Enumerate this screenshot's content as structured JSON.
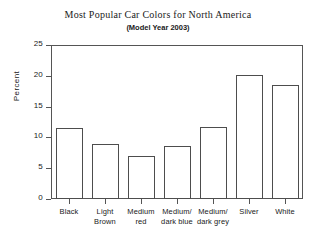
{
  "chart_data": {
    "type": "bar",
    "title": "Most Popular Car Colors for North America",
    "subtitle": "(Model Year 2003)",
    "xlabel": "",
    "ylabel": "Percent",
    "categories": [
      "Black",
      "Light Brown",
      "Medium red",
      "Medium/dark blue",
      "Medium/dark grey",
      "Silver",
      "White"
    ],
    "category_lines": [
      [
        "Black",
        ""
      ],
      [
        "Light",
        "Brown"
      ],
      [
        "Medium",
        "red"
      ],
      [
        "Medium/",
        "dark blue"
      ],
      [
        "Medium/",
        "dark grey"
      ],
      [
        "Silver",
        ""
      ],
      [
        "White",
        ""
      ]
    ],
    "values": [
      11.6,
      9.0,
      7.0,
      8.6,
      11.7,
      20.2,
      18.5
    ],
    "ylim": [
      0,
      25
    ],
    "yticks": [
      0,
      5,
      10,
      15,
      20,
      25
    ],
    "ytick_labels": [
      "0",
      "5",
      "10",
      "15",
      "20",
      "25"
    ],
    "grid": false,
    "legend": false,
    "bar_fill_color": "#ffffff",
    "bar_edge_color": "#4d4d4d",
    "axis_color": "#555555",
    "text_color": "#1a1a1a",
    "background_color": "#ffffff"
  }
}
